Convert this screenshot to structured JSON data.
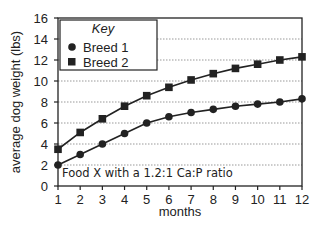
{
  "chart_data": {
    "type": "line",
    "title": "",
    "xlabel": "months",
    "ylabel": "average dog weight (lbs)",
    "x": [
      1,
      2,
      3,
      4,
      5,
      6,
      7,
      8,
      9,
      10,
      11,
      12
    ],
    "xlim": [
      1,
      12
    ],
    "ylim": [
      0,
      16
    ],
    "yticks": [
      0,
      2,
      4,
      6,
      8,
      10,
      12,
      14,
      16
    ],
    "grid": "horizontal dotted",
    "legend": {
      "title": "Key",
      "position": "upper left"
    },
    "annotation": "Food X with a 1.2:1 Ca:P ratio",
    "series": [
      {
        "name": "Breed 1",
        "marker": "circle",
        "values": [
          2.0,
          3.0,
          4.0,
          5.0,
          6.0,
          6.6,
          7.0,
          7.3,
          7.6,
          7.8,
          8.0,
          8.3
        ]
      },
      {
        "name": "Breed 2",
        "marker": "square",
        "values": [
          3.5,
          5.1,
          6.4,
          7.6,
          8.6,
          9.4,
          10.1,
          10.7,
          11.2,
          11.6,
          12.0,
          12.3
        ]
      }
    ]
  },
  "labels": {
    "xlabel": "months",
    "ylabel": "average dog weight (lbs)",
    "legend_title": "Key",
    "legend_1": "Breed 1",
    "legend_2": "Breed 2",
    "annotation": "Food X with a 1.2:1 Ca:P ratio"
  }
}
